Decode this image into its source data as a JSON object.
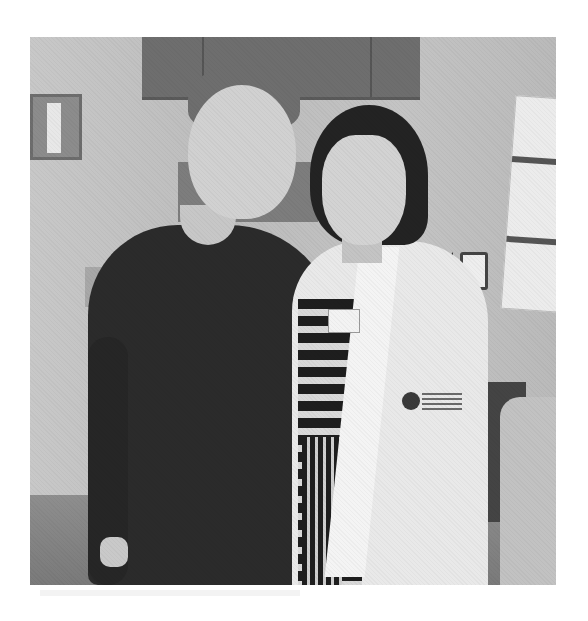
{
  "image": {
    "description": "Grayscale photograph of two women standing side by side smiling in a medical exam room; the woman on the right wears a white lab coat over a striped dress",
    "colors": {
      "background": "#ffffff",
      "wall": "#bdbdbd",
      "cabinet": "#6e6e6e",
      "dark_top": "#2b2b2b",
      "lab_coat": "#e9e9e9"
    },
    "scene_elements": [
      "wall cabinets",
      "wall-mounted dispenser",
      "wall calendar",
      "light switch",
      "lab coat with embroidered logo",
      "name badge",
      "exam chair"
    ]
  }
}
